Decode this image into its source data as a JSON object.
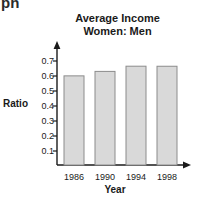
{
  "clipped_text": "ph",
  "chart_data": {
    "type": "bar",
    "title": "Average Income Women: Men",
    "title_line1": "Average Income",
    "title_line2": "Women: Men",
    "xlabel": "Year",
    "ylabel": "Ratio",
    "categories": [
      "1986",
      "1990",
      "1994",
      "1998"
    ],
    "values": [
      0.555,
      0.6,
      0.63,
      0.665
    ],
    "ylim": [
      0,
      0.75
    ],
    "yticks": [
      "0.7",
      "0.6",
      "0.5",
      "0.4",
      "0.3",
      "0.2",
      "0.1"
    ],
    "ytick_values": [
      0.7,
      0.6,
      0.5,
      0.4,
      0.3,
      0.2,
      0.1
    ],
    "grid": false,
    "legend": false,
    "bar_fill": "#d9d9d9",
    "bar_stroke": "#8c8c8c",
    "axis_color": "#1a1a1a"
  }
}
